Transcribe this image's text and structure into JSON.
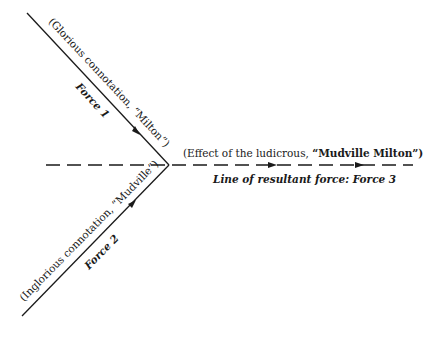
{
  "diagram": {
    "colors": {
      "ink": "#1a1a1a",
      "background": "#ffffff"
    },
    "force1": {
      "connotation_label": "(Glorious connotation, “Milton”)",
      "force_label": "Force 1",
      "line": {
        "x1": 27,
        "y1": 13,
        "x2": 169,
        "y2": 165
      }
    },
    "force2": {
      "connotation_label": "(Inglorious connotation, “Mudville”)",
      "force_label": "Force 2",
      "line": {
        "x1": 22,
        "y1": 316,
        "x2": 169,
        "y2": 165
      }
    },
    "force3": {
      "effect_label_prefix": "(Effect of the ludicrous, ",
      "effect_label_bold": "“Mudville Milton”)",
      "resultant_label": "Line of resultant force: Force 3",
      "line": {
        "x1": 46,
        "y1": 165,
        "x2": 413,
        "y2": 165,
        "style": "dashed"
      }
    }
  }
}
